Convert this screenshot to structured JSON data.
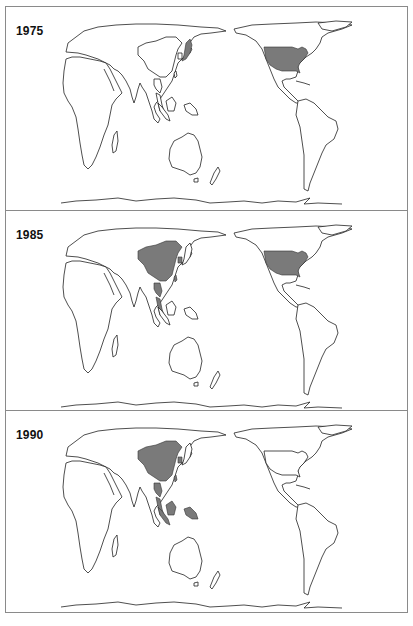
{
  "figure": {
    "projection": "world map, Pacific-centred",
    "shade_color": "#7a7a7a",
    "outline_color": "#222222",
    "panels": [
      {
        "year": "1975",
        "shaded_countries": [
          "United States",
          "Japan"
        ]
      },
      {
        "year": "1985",
        "shaded_countries": [
          "United States",
          "China",
          "South Korea",
          "Taiwan",
          "Thailand",
          "Malaysia"
        ]
      },
      {
        "year": "1990",
        "shaded_countries": [
          "China",
          "South Korea",
          "Taiwan",
          "Thailand",
          "Malaysia",
          "Indonesia"
        ]
      }
    ]
  }
}
